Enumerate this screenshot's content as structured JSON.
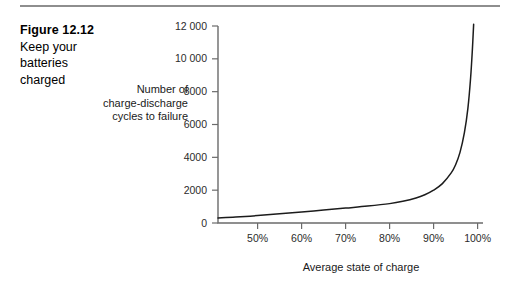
{
  "figure": {
    "rule_color": "#8e8e8e",
    "caption_number": "Figure 12.12",
    "caption_line1": "Keep your",
    "caption_line2": "batteries",
    "caption_line3": "charged"
  },
  "axis_titles": {
    "y_line1": "Number of",
    "y_line2": "charge-discharge",
    "y_line3": "cycles to failure",
    "x": "Average state of charge"
  },
  "chart_data": {
    "type": "line",
    "title": "Keep your batteries charged",
    "xlabel": "Average state of charge",
    "ylabel": "Number of charge-discharge cycles to failure",
    "xlim": [
      41,
      101
    ],
    "ylim": [
      0,
      12600
    ],
    "grid": false,
    "legend": null,
    "line_color": "#1c1c1c",
    "x_tick_labels": [
      "50%",
      "60%",
      "70%",
      "80%",
      "90%",
      "100%"
    ],
    "x_tick_values": [
      50,
      60,
      70,
      80,
      90,
      100
    ],
    "y_tick_labels": [
      "0",
      "2000",
      "4000",
      "6000",
      "8000",
      "10 000",
      "12 000"
    ],
    "y_tick_values": [
      0,
      2000,
      4000,
      6000,
      8000,
      10000,
      12000
    ],
    "series": [
      {
        "name": "Cycles to failure",
        "x": [
          41,
          45,
          50,
          55,
          60,
          65,
          70,
          75,
          80,
          83,
          86,
          88,
          90,
          92,
          94,
          95,
          96,
          97,
          97.8,
          98.4,
          98.8,
          99.1
        ],
        "values": [
          310,
          360,
          450,
          560,
          670,
          790,
          910,
          1030,
          1180,
          1320,
          1520,
          1720,
          2000,
          2400,
          3050,
          3550,
          4300,
          5500,
          7000,
          8800,
          10500,
          12100
        ]
      }
    ]
  }
}
